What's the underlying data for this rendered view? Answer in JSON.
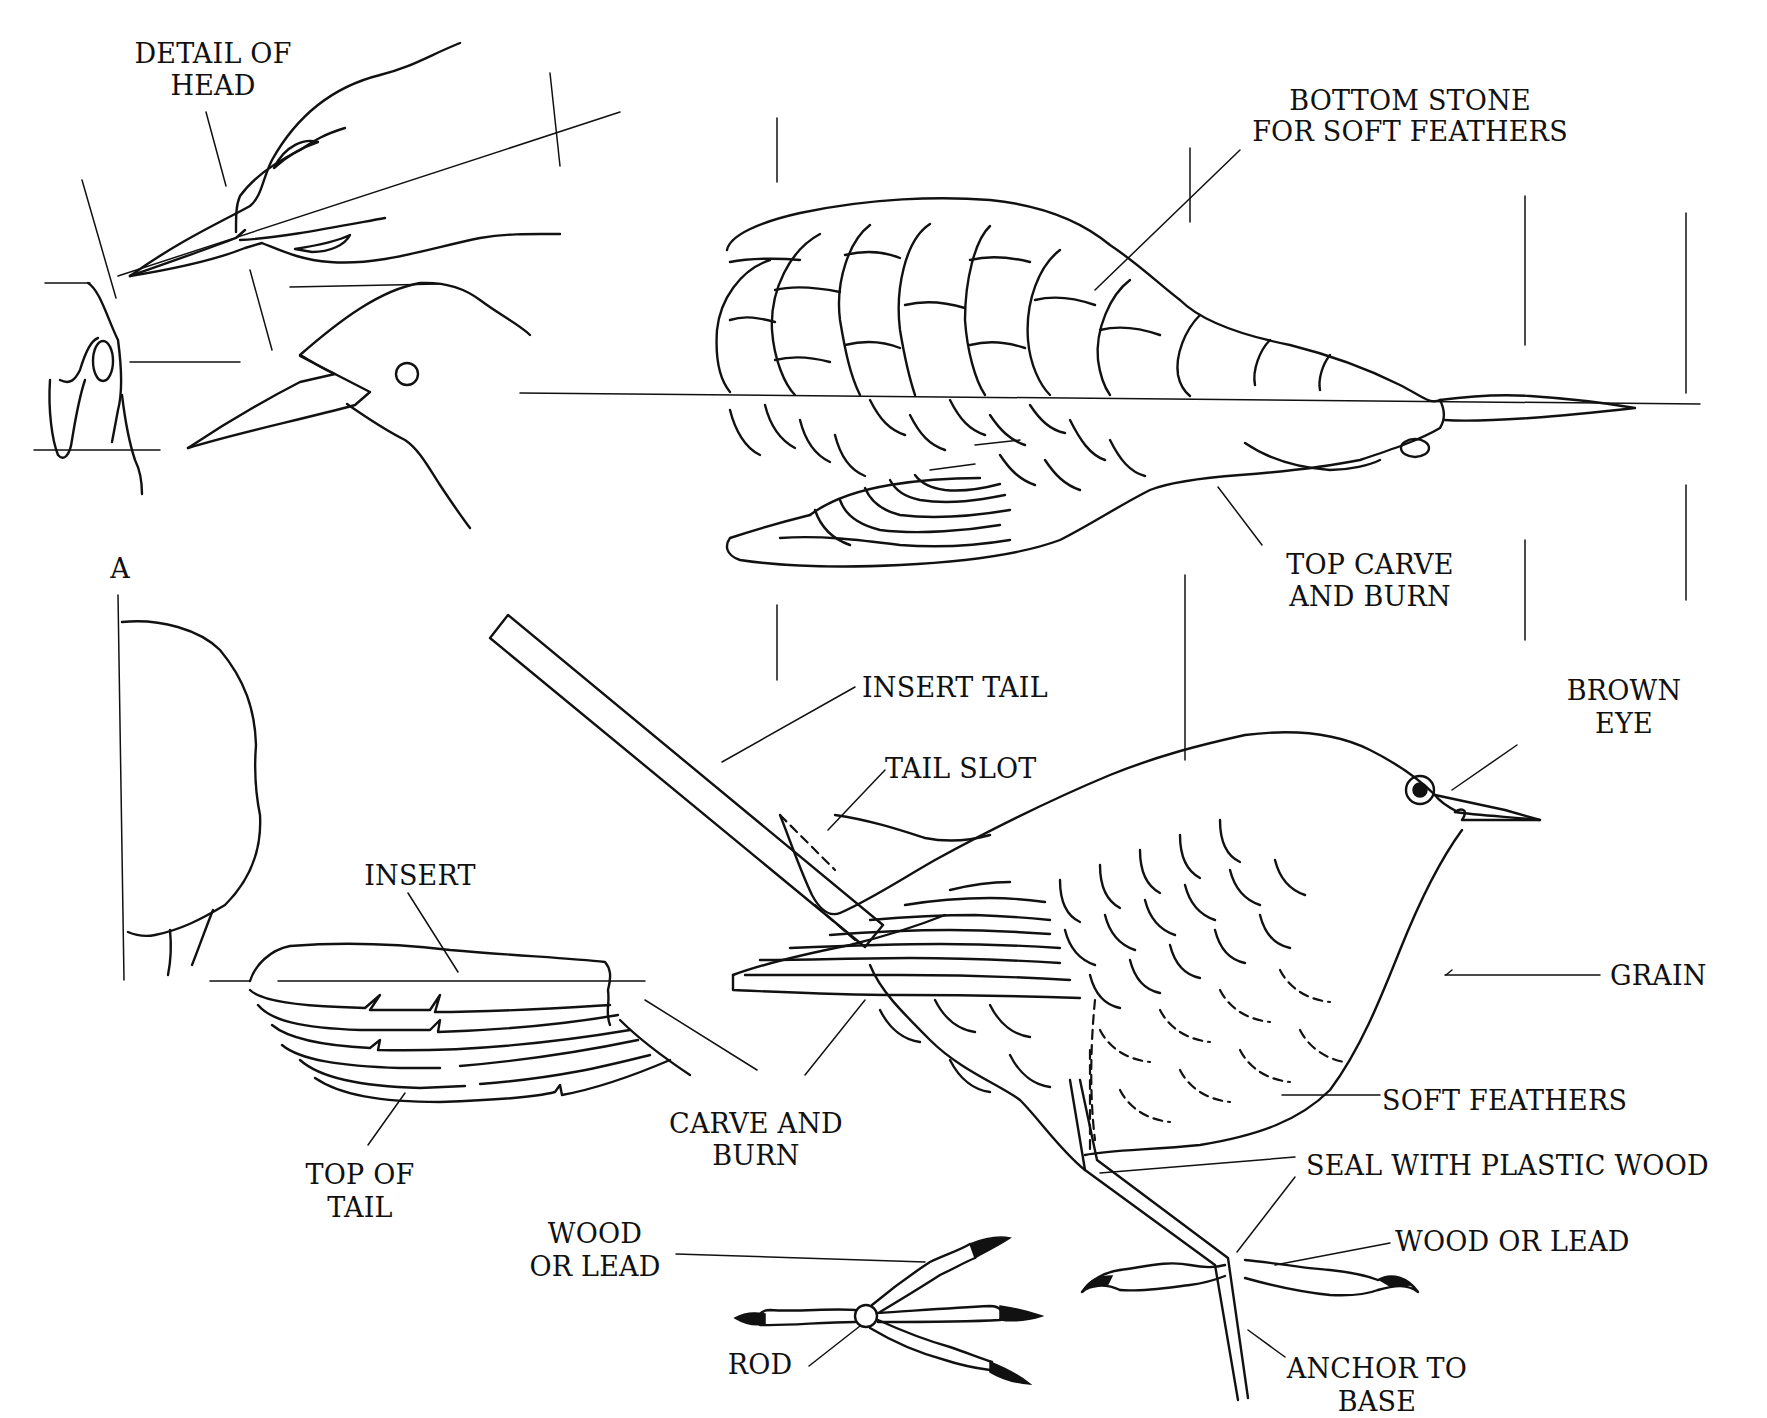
{
  "diagram": {
    "views": [
      {
        "id": "head-detail",
        "description": "Detail of head (top view and side profile)"
      },
      {
        "id": "bottom-view",
        "description": "Bottom/top view of body with wing"
      },
      {
        "id": "section-a",
        "description": "Cross section marked A"
      },
      {
        "id": "tail-insert",
        "description": "Tail insert, top of tail"
      },
      {
        "id": "side-view",
        "description": "Full bird side view with legs and rod"
      },
      {
        "id": "foot-detail",
        "description": "Foot with rod, wood or lead toes"
      }
    ],
    "labels": {
      "detail_of_head": [
        "DETAIL OF",
        "HEAD"
      ],
      "bottom_stone": [
        "BOTTOM STONE",
        "FOR SOFT FEATHERS"
      ],
      "top_carve_and_burn": [
        "TOP CARVE",
        "AND BURN"
      ],
      "section_a": "A",
      "insert_tail": "INSERT TAIL",
      "brown_eye": [
        "BROWN",
        "EYE"
      ],
      "tail_slot": "TAIL SLOT",
      "insert": "INSERT",
      "grain": "GRAIN",
      "soft_feathers": "SOFT FEATHERS",
      "carve_and_burn": [
        "CARVE AND",
        "BURN"
      ],
      "seal_with_plastic_wood": "SEAL WITH PLASTIC WOOD",
      "top_of_tail": [
        "TOP OF",
        "TAIL"
      ],
      "wood_or_lead_left": [
        "WOOD",
        "OR LEAD"
      ],
      "wood_or_lead_right": "WOOD OR LEAD",
      "rod": "ROD",
      "anchor_to_base": [
        "ANCHOR TO",
        "BASE"
      ]
    },
    "colors": {
      "ink": "#111111",
      "paper": "#ffffff"
    }
  }
}
